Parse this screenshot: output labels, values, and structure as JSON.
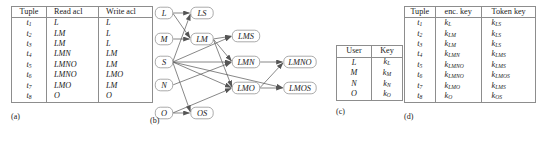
{
  "figure": {
    "panels": [
      {
        "id": "a",
        "caption": "(a)"
      },
      {
        "id": "b",
        "caption": "(b)"
      },
      {
        "id": "c",
        "caption": "(c)"
      },
      {
        "id": "d",
        "caption": "(d)"
      }
    ]
  },
  "panel_a": {
    "caption": "(a)",
    "columns": [
      "Tuple",
      "Read acl",
      "Write acl"
    ],
    "rows": [
      {
        "tuple": "t",
        "tuple_sub": "1",
        "read": "L",
        "write": "L"
      },
      {
        "tuple": "t",
        "tuple_sub": "2",
        "read": "LM",
        "write": "L"
      },
      {
        "tuple": "t",
        "tuple_sub": "3",
        "read": "LM",
        "write": "L"
      },
      {
        "tuple": "t",
        "tuple_sub": "4",
        "read": "LMN",
        "write": "LM"
      },
      {
        "tuple": "t",
        "tuple_sub": "5",
        "read": "LMNO",
        "write": "LM"
      },
      {
        "tuple": "t",
        "tuple_sub": "6",
        "read": "LMNO",
        "write": "LMO"
      },
      {
        "tuple": "t",
        "tuple_sub": "7",
        "read": "LMO",
        "write": "LM"
      },
      {
        "tuple": "t",
        "tuple_sub": "8",
        "read": "O",
        "write": "O"
      }
    ]
  },
  "panel_b": {
    "caption": "(b)",
    "nodes": [
      {
        "id": "L",
        "label": "L",
        "x": 14,
        "y": 13
      },
      {
        "id": "LS",
        "label": "LS",
        "x": 52,
        "y": 13
      },
      {
        "id": "M",
        "label": "M",
        "x": 14,
        "y": 39
      },
      {
        "id": "LM",
        "label": "LM",
        "x": 52,
        "y": 39
      },
      {
        "id": "LMS",
        "label": "LMS",
        "x": 96,
        "y": 36
      },
      {
        "id": "S",
        "label": "S",
        "x": 14,
        "y": 62
      },
      {
        "id": "LMN",
        "label": "LMN",
        "x": 96,
        "y": 62
      },
      {
        "id": "LMNO",
        "label": "LMNO",
        "x": 150,
        "y": 62
      },
      {
        "id": "N",
        "label": "N",
        "x": 14,
        "y": 85
      },
      {
        "id": "LMO",
        "label": "LMO",
        "x": 96,
        "y": 88
      },
      {
        "id": "LMOS",
        "label": "LMOS",
        "x": 150,
        "y": 88
      },
      {
        "id": "O",
        "label": "O",
        "x": 14,
        "y": 113
      },
      {
        "id": "OS",
        "label": "OS",
        "x": 52,
        "y": 113
      }
    ],
    "edges": [
      {
        "from": "L",
        "to": "LS"
      },
      {
        "from": "L",
        "to": "LM"
      },
      {
        "from": "M",
        "to": "LM"
      },
      {
        "from": "S",
        "to": "LS"
      },
      {
        "from": "S",
        "to": "LMS"
      },
      {
        "from": "S",
        "to": "LMN"
      },
      {
        "from": "S",
        "to": "LMO"
      },
      {
        "from": "S",
        "to": "OS"
      },
      {
        "from": "LM",
        "to": "LMS"
      },
      {
        "from": "LM",
        "to": "LMN"
      },
      {
        "from": "LM",
        "to": "LMO"
      },
      {
        "from": "N",
        "to": "LMN"
      },
      {
        "from": "O",
        "to": "OS"
      },
      {
        "from": "O",
        "to": "LMO"
      },
      {
        "from": "LMN",
        "to": "LMNO"
      },
      {
        "from": "LMO",
        "to": "LMNO"
      },
      {
        "from": "LMO",
        "to": "LMOS"
      },
      {
        "from": "S",
        "to": "LMOS"
      }
    ]
  },
  "panel_c": {
    "caption": "(c)",
    "columns": [
      "User",
      "Key"
    ],
    "rows": [
      {
        "user": "L",
        "key": "k",
        "key_sub": "L"
      },
      {
        "user": "M",
        "key": "k",
        "key_sub": "M"
      },
      {
        "user": "N",
        "key": "k",
        "key_sub": "N"
      },
      {
        "user": "O",
        "key": "k",
        "key_sub": "O"
      }
    ]
  },
  "panel_d": {
    "caption": "(d)",
    "columns": [
      "Tuple",
      "enc. key",
      "Token key"
    ],
    "rows": [
      {
        "tuple": "t",
        "tuple_sub": "1",
        "enc": "k",
        "enc_sub": "L",
        "tok": "k",
        "tok_sub": "LS"
      },
      {
        "tuple": "t",
        "tuple_sub": "2",
        "enc": "k",
        "enc_sub": "LM",
        "tok": "k",
        "tok_sub": "LS"
      },
      {
        "tuple": "t",
        "tuple_sub": "3",
        "enc": "k",
        "enc_sub": "LM",
        "tok": "k",
        "tok_sub": "LS"
      },
      {
        "tuple": "t",
        "tuple_sub": "4",
        "enc": "k",
        "enc_sub": "LMN",
        "tok": "k",
        "tok_sub": "LMS"
      },
      {
        "tuple": "t",
        "tuple_sub": "5",
        "enc": "k",
        "enc_sub": "LMNO",
        "tok": "k",
        "tok_sub": "LMS"
      },
      {
        "tuple": "t",
        "tuple_sub": "6",
        "enc": "k",
        "enc_sub": "LMNO",
        "tok": "k",
        "tok_sub": "LMOS"
      },
      {
        "tuple": "t",
        "tuple_sub": "7",
        "enc": "k",
        "enc_sub": "LMO",
        "tok": "k",
        "tok_sub": "LMS"
      },
      {
        "tuple": "t",
        "tuple_sub": "8",
        "enc": "k",
        "enc_sub": "O",
        "tok": "k",
        "tok_sub": "OS"
      }
    ]
  },
  "colors": {
    "line": "#8d8d8d",
    "edge": "#555555",
    "text": "#1a1a1a",
    "background": "#ffffff"
  }
}
